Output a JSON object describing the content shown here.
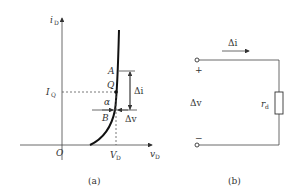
{
  "figure_a": {
    "y_axis_label": "i",
    "y_axis_sub": "D",
    "x_axis_label": "v",
    "x_axis_sub": "D",
    "origin_label": "O",
    "iq_label": "I",
    "iq_sub": "Q",
    "vd_label": "V",
    "vd_sub": "D",
    "point_a": "A",
    "point_q": "Q",
    "point_b": "B",
    "angle": "α",
    "delta_i": "Δi",
    "delta_v": "Δv",
    "caption": "(a)"
  },
  "figure_b": {
    "current_label": "Δi",
    "plus": "+",
    "minus": "−",
    "voltage_label": "Δv",
    "resistor_label": "r",
    "resistor_sub": "d",
    "caption": "(b)"
  }
}
